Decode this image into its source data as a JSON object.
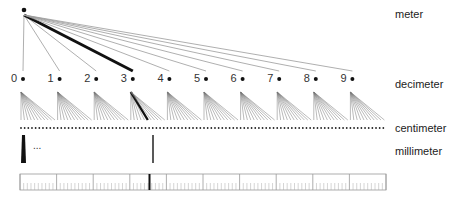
{
  "diagram": {
    "levels": [
      {
        "id": "meter",
        "label": "meter",
        "y": 9
      },
      {
        "id": "decimeter",
        "label": "decimeter",
        "y": 79
      },
      {
        "id": "centimeter",
        "label": "centimeter",
        "y": 123
      },
      {
        "id": "millimeter",
        "label": "millimeter",
        "y": 146
      }
    ],
    "decimeter_nodes": [
      "0",
      "1",
      "2",
      "3",
      "4",
      "5",
      "6",
      "7",
      "8",
      "9"
    ],
    "highlighted_decimeter": 3,
    "ellipsis": "...",
    "colors": {
      "line": "#999999",
      "highlight": "#111111",
      "text": "#222222"
    }
  }
}
